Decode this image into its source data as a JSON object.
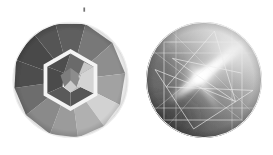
{
  "figure": {
    "title": "",
    "caption": "",
    "background_color": "#ffffff",
    "width": 273,
    "height": 155,
    "panels": [
      {
        "id": "panel-left",
        "name": "faceted-gem-color-map",
        "description": "Circular faceted gemstone diagram viewed from above with an outer ring of wedge facets and a white-outlined inner hexagonal table",
        "center_x": 70.5,
        "center_y": 80,
        "radius": 58,
        "outline_color": "#ffffff",
        "outline_width": 1.6,
        "ring": {
          "name": "outer-crown-facets",
          "inner_radius": 31,
          "count": 12,
          "start_angle_deg": -105,
          "facet_colors": [
            "#5e5e5e",
            "#787878",
            "#8e8e8e",
            "#9a9a9a",
            "#a9a9a9",
            "#d2d2d2",
            "#b4b4b4",
            "#959595",
            "#868686",
            "#6f6f6f",
            "#4f4f4f",
            "#4a4a4a"
          ]
        },
        "inner_band": {
          "name": "girdle-band",
          "color": "#f2f2f2",
          "outer_radius": 31,
          "inner_radius": 26.5,
          "sides": 6,
          "rotation_deg": 0
        },
        "table": {
          "name": "table-facets",
          "radius": 26.5,
          "sides": 6,
          "rotation_deg": 0,
          "core": {
            "name": "center-pavilion",
            "radius": 10.5,
            "sides": 5,
            "rotation_deg": -18,
            "color": "#7e7e7e"
          },
          "facet_colors": [
            "#4b4b4b",
            "#565656",
            "#8c8c8c",
            "#d8d8d8",
            "#c2c2c2",
            "#4d4d4d"
          ]
        }
      },
      {
        "id": "panel-right",
        "name": "gem-caustic-luminance-map",
        "description": "Circular smooth luminance / caustic rendering of the same gem with a bright diagonal specular streak and thin white facet reflection lines forming a star polygon",
        "center_x": 204,
        "center_y": 80,
        "radius": 58,
        "background_gradient": {
          "dark_color": "#4f4f4f",
          "mid_color": "#9a9a9a",
          "light_color": "#e8e8e8"
        },
        "hotspot": {
          "name": "specular-highlight",
          "x": 202,
          "y": 76,
          "color": "#ffffff",
          "intensity": 1.0
        },
        "streak": {
          "name": "specular-streak",
          "angle_deg": -38,
          "color": "#ffffff"
        },
        "facet_lines": {
          "name": "facet-reflection-lines",
          "color": "#e9e9e9",
          "width": 0.7,
          "star_points": 8,
          "star_radius": 50,
          "rotation_deg": 12,
          "square_half_size": 40
        }
      }
    ],
    "artifact": {
      "name": "scan-speck",
      "x": 84,
      "y": 9,
      "color": "#5a5a5a"
    }
  }
}
